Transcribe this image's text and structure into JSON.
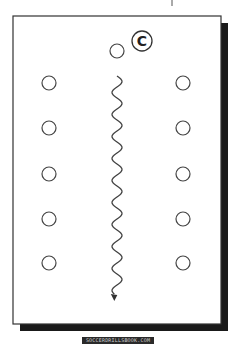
{
  "diagram": {
    "type": "formation-diagram",
    "frame": {
      "x": 13,
      "y": 16,
      "width": 208,
      "height": 308,
      "shadow_offset": 7,
      "border_color": "#333333",
      "shadow_color": "#1a1a1a"
    },
    "center_marker": {
      "label": "C",
      "x": 142,
      "y": 41,
      "r": 10
    },
    "top_player": {
      "x": 117,
      "y": 51,
      "r": 7
    },
    "left_column": [
      {
        "x": 49,
        "y": 83
      },
      {
        "x": 49,
        "y": 128
      },
      {
        "x": 49,
        "y": 174
      },
      {
        "x": 49,
        "y": 219
      },
      {
        "x": 49,
        "y": 263
      }
    ],
    "right_column": [
      {
        "x": 183,
        "y": 83
      },
      {
        "x": 183,
        "y": 128
      },
      {
        "x": 183,
        "y": 174
      },
      {
        "x": 183,
        "y": 219
      },
      {
        "x": 183,
        "y": 263
      }
    ],
    "player_radius": 7,
    "path": {
      "x": 117,
      "y_start": 76,
      "y_end": 302,
      "amplitude": 5,
      "period": 22,
      "arrow": "down",
      "color": "#444444"
    },
    "top_tick": {
      "x": 172,
      "y1": 0,
      "y2": 6
    }
  },
  "caption": {
    "text": "SOCCERDRILLSBOOK.COM"
  }
}
